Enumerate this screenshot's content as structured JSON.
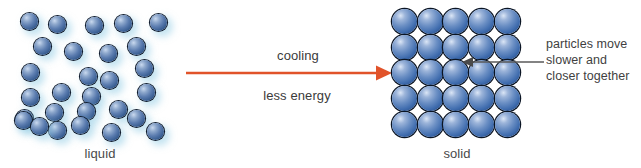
{
  "diagram": {
    "background_color": "#ffffff"
  },
  "liquid_panel": {
    "caption": "liquid",
    "state": "liquid",
    "particle_count": 28,
    "particle_color": "#3f6cae",
    "glow_color": "#96cde6",
    "particle_diameter_px": 17,
    "particles": [
      {
        "x": 21,
        "y": 13
      },
      {
        "x": 49,
        "y": 16
      },
      {
        "x": 86,
        "y": 17
      },
      {
        "x": 115,
        "y": 15
      },
      {
        "x": 150,
        "y": 14
      },
      {
        "x": 34,
        "y": 38
      },
      {
        "x": 65,
        "y": 43
      },
      {
        "x": 100,
        "y": 45
      },
      {
        "x": 128,
        "y": 38
      },
      {
        "x": 22,
        "y": 64
      },
      {
        "x": 80,
        "y": 68
      },
      {
        "x": 101,
        "y": 72
      },
      {
        "x": 136,
        "y": 60
      },
      {
        "x": 53,
        "y": 84
      },
      {
        "x": 22,
        "y": 89
      },
      {
        "x": 83,
        "y": 88
      },
      {
        "x": 138,
        "y": 84
      },
      {
        "x": 46,
        "y": 104
      },
      {
        "x": 16,
        "y": 110
      },
      {
        "x": 78,
        "y": 103
      },
      {
        "x": 110,
        "y": 101
      },
      {
        "x": 15,
        "y": 112
      },
      {
        "x": 49,
        "y": 122
      },
      {
        "x": 72,
        "y": 117
      },
      {
        "x": 128,
        "y": 110
      },
      {
        "x": 103,
        "y": 124
      },
      {
        "x": 147,
        "y": 123
      },
      {
        "x": 31,
        "y": 118
      }
    ]
  },
  "solid_panel": {
    "caption": "solid",
    "state": "solid",
    "rows": 5,
    "cols": 5,
    "particle_count": 25,
    "particle_color": "#3f6cae",
    "particle_diameter_px": 25,
    "spacing_px": 25.7
  },
  "process_arrow": {
    "direction": "left-to-right",
    "color": "#e1532a",
    "label_above": "cooling",
    "label_below": "less energy"
  },
  "annotation": {
    "leader_color": "#5a5a5a",
    "points_to": "solid-lattice",
    "lines": [
      "particles move",
      "slower and",
      "closer together"
    ]
  }
}
